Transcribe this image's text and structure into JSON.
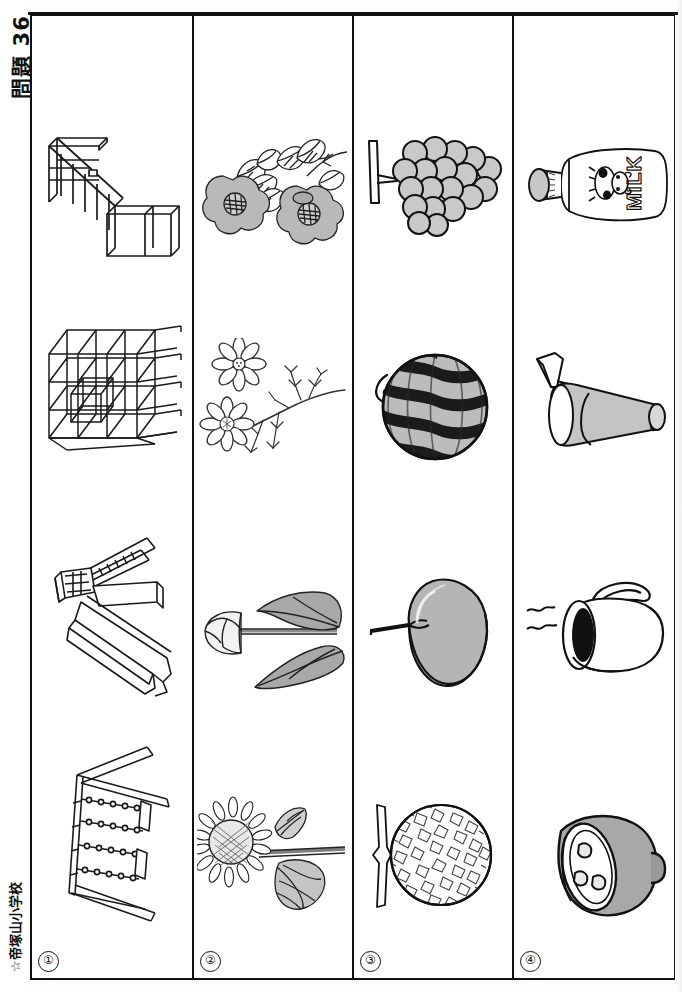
{
  "page": {
    "title": "問題 36",
    "school": "☆帝塚山小学校",
    "width": 682,
    "height": 992,
    "orientation": "rotated-landscape",
    "ink_color": "#111111",
    "paper_color": "#fdfdfd"
  },
  "bands": [
    {
      "number": "①",
      "category": "playground-equipment",
      "items": [
        {
          "name": "horizontal-ladder",
          "label": "うんてい"
        },
        {
          "name": "jungle-gym",
          "label": "ジャングルジム"
        },
        {
          "name": "slide",
          "label": "すべりだい"
        },
        {
          "name": "swing-set",
          "label": "ぶらんこ"
        }
      ]
    },
    {
      "number": "②",
      "category": "flowers",
      "items": [
        {
          "name": "camellia",
          "label": "つばき"
        },
        {
          "name": "cosmos",
          "label": "コスモス"
        },
        {
          "name": "tulip",
          "label": "チューリップ"
        },
        {
          "name": "sunflower",
          "label": "ひまわり"
        }
      ]
    },
    {
      "number": "③",
      "category": "fruits",
      "items": [
        {
          "name": "grapes",
          "label": "ぶどう"
        },
        {
          "name": "watermelon",
          "label": "すいか"
        },
        {
          "name": "apple",
          "label": "りんご"
        },
        {
          "name": "melon",
          "label": "メロン"
        }
      ]
    },
    {
      "number": "④",
      "category": "drinks",
      "items": [
        {
          "name": "milk-bottle",
          "label": "ぎゅうにゅう",
          "bottle_text": "MILK"
        },
        {
          "name": "cup-with-straw",
          "label": "ジュース"
        },
        {
          "name": "coffee-mug",
          "label": "コーヒー"
        },
        {
          "name": "rice-bowl",
          "label": "おちゃわん"
        }
      ]
    }
  ]
}
